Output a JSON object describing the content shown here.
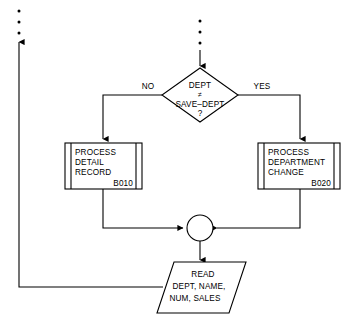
{
  "diagram": {
    "type": "program-flowchart",
    "colors": {
      "background": "#ffffff",
      "stroke": "#000000",
      "fill": "#ffffff"
    }
  },
  "decision": {
    "line1": "DEPT",
    "operator": "≠",
    "line2": "SAVE–DEPT",
    "line3": "?",
    "branch_no": "NO",
    "branch_yes": "YES"
  },
  "process_left": {
    "line1": "PROCESS",
    "line2": "DETAIL",
    "line3": "RECORD",
    "ref": "B010"
  },
  "process_right": {
    "line1": "PROCESS",
    "line2": "DEPARTMENT",
    "line3": "CHANGE",
    "ref": "B020"
  },
  "io_read": {
    "line1": "READ",
    "line2": "DEPT, NAME,",
    "line3": "NUM, SALES"
  },
  "connector": {
    "label": ""
  },
  "continuation_marks": {
    "left_label": "vertical-ellipsis",
    "top_label": "vertical-ellipsis",
    "dot_count": 3
  }
}
